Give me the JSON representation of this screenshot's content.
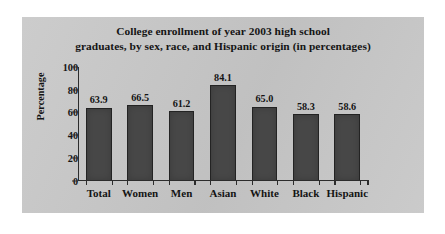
{
  "chart_data": {
    "type": "bar",
    "title": "College enrollment of year 2003 high school graduates, by sex, race, and Hispanic origin (in percentages)",
    "title_lines": [
      "College enrollment of year 2003 high school",
      "graduates, by sex, race, and Hispanic origin (in percentages)"
    ],
    "categories": [
      "Total",
      "Women",
      "Men",
      "Asian",
      "White",
      "Black",
      "Hispanic"
    ],
    "values": [
      63.9,
      66.5,
      61.2,
      84.1,
      65.0,
      58.3,
      58.6
    ],
    "value_labels": [
      "63.9",
      "66.5",
      "61.2",
      "84.1",
      "65.0",
      "58.3",
      "58.6"
    ],
    "xlabel": "",
    "ylabel": "Percentage",
    "ylim": [
      0,
      100
    ],
    "ytick_values": [
      0,
      20,
      40,
      60,
      80,
      100
    ],
    "ytick_labels": [
      "0",
      "20",
      "40",
      "60",
      "80",
      "100"
    ],
    "grid": false,
    "legend": false,
    "legend_position": "none",
    "bar_color": "#474747",
    "bar_edge_color": "#232323",
    "panel_color": "#c9c9c9",
    "text_color": "#141414",
    "page_color": "#ffffff"
  }
}
